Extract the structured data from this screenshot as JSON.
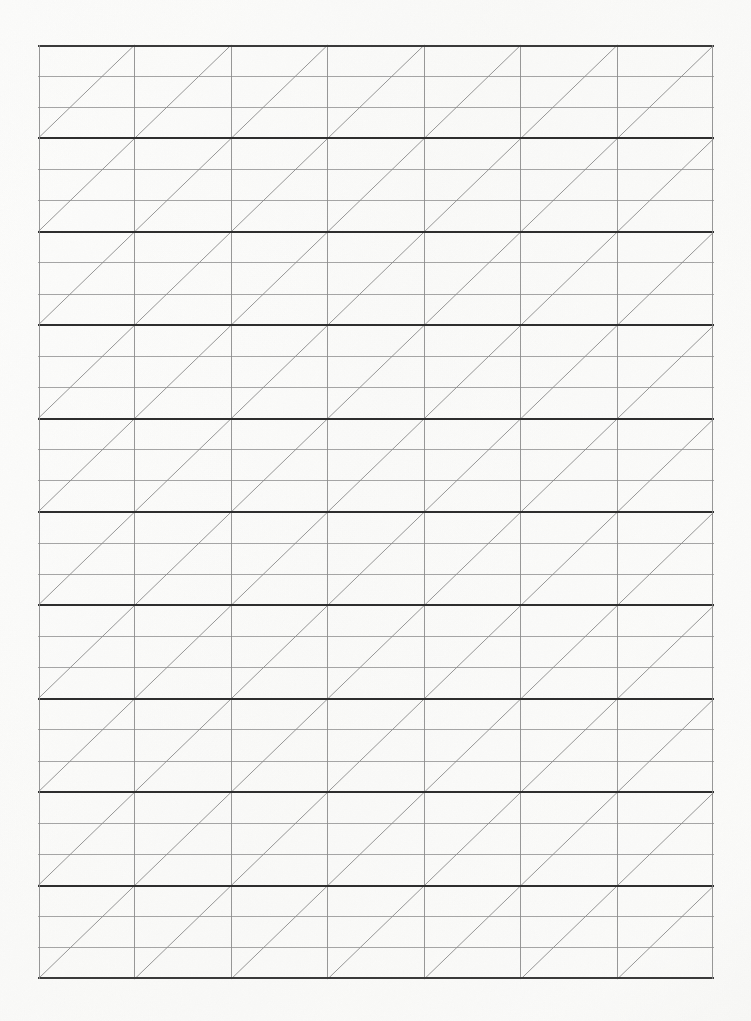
{
  "document": {
    "kind": "ruled-grid-paper-sheet",
    "title": "Blank triangle-ruled graph paper",
    "orientation": "portrait",
    "page_width_px": 751,
    "page_height_px": 1021,
    "paper_color": "#fdfdfc",
    "page_edge_tint": "#f1f1ee",
    "has_text_content": false,
    "visible_text": ""
  },
  "grid": {
    "left_px": 38,
    "top_px": 45,
    "right_px": 714,
    "bottom_px": 979,
    "width_px": 676,
    "height_px": 934,
    "columns": 7,
    "major_rows": 10,
    "cell_width_px": 96.57,
    "major_row_height_px": 93.4,
    "minor_rows_per_major_row": 3,
    "minor_row_height_px": 31.13,
    "diagonal_direction": "bottom-left-to-top-right",
    "diagonals_per_cell": 1,
    "total_cells": 70,
    "total_diagonals": 70,
    "colors": {
      "major_horizontal_rule": "#2e2e2e",
      "minor_horizontal_rule": "#9b9b9b",
      "vertical_rule": "#8c8c8c",
      "outer_border": "#3a3a3a",
      "diagonal_rule": "#8a8a8a"
    },
    "line_widths": {
      "major_horizontal_rule_px": 2.1,
      "minor_horizontal_rule_px": 0.9,
      "vertical_rule_px": 0.9,
      "outer_border_px": 2.1,
      "diagonal_rule_px": 0.9
    }
  },
  "chart_data": {
    "type": "table",
    "columns": 7,
    "rows": 10,
    "subdivisions_per_row": 3,
    "cell_contents": [
      [
        "",
        "",
        "",
        "",
        "",
        "",
        ""
      ],
      [
        "",
        "",
        "",
        "",
        "",
        "",
        ""
      ],
      [
        "",
        "",
        "",
        "",
        "",
        "",
        ""
      ],
      [
        "",
        "",
        "",
        "",
        "",
        "",
        ""
      ],
      [
        "",
        "",
        "",
        "",
        "",
        "",
        ""
      ],
      [
        "",
        "",
        "",
        "",
        "",
        "",
        ""
      ],
      [
        "",
        "",
        "",
        "",
        "",
        "",
        ""
      ],
      [
        "",
        "",
        "",
        "",
        "",
        "",
        ""
      ],
      [
        "",
        "",
        "",
        "",
        "",
        "",
        ""
      ],
      [
        "",
        "",
        "",
        "",
        "",
        "",
        ""
      ]
    ]
  }
}
